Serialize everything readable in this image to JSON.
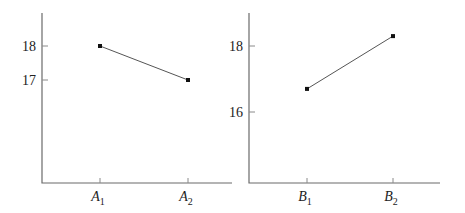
{
  "chart_data": [
    {
      "type": "line",
      "title": "",
      "xlabel": "",
      "ylabel": "",
      "categories": [
        {
          "base": "A",
          "sub": "1"
        },
        {
          "base": "A",
          "sub": "2"
        }
      ],
      "category_labels": [
        "A1",
        "A2"
      ],
      "values": [
        18,
        17
      ],
      "yticks": [
        17,
        18
      ],
      "ylim": [
        13.9,
        19
      ],
      "grid": false,
      "legend": null
    },
    {
      "type": "line",
      "title": "",
      "xlabel": "",
      "ylabel": "",
      "categories": [
        {
          "base": "B",
          "sub": "1"
        },
        {
          "base": "B",
          "sub": "2"
        }
      ],
      "category_labels": [
        "B1",
        "B2"
      ],
      "values": [
        16.7,
        18.3
      ],
      "yticks": [
        16,
        18
      ],
      "ylim": [
        13.9,
        19
      ],
      "grid": false,
      "legend": null
    }
  ]
}
